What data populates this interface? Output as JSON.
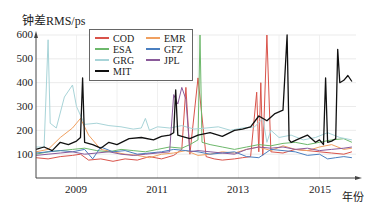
{
  "chart_data": {
    "type": "line",
    "title": "",
    "ylabel": "钟差RMS/ps",
    "xlabel": "年份",
    "ylim": [
      0,
      600
    ],
    "xlim": [
      2008.0,
      2016.0
    ],
    "yticks": [
      100,
      200,
      300,
      400,
      500,
      600
    ],
    "xticks": [
      "2009",
      "2011",
      "2013",
      "2015"
    ],
    "grid": true,
    "legend_position": "upper left (inside, offset)",
    "series": [
      {
        "name": "COD",
        "color": "#d9534a",
        "x": [
          2008.0,
          2008.3,
          2008.6,
          2008.9,
          2009.1,
          2009.3,
          2009.6,
          2009.9,
          2010.2,
          2010.5,
          2010.8,
          2011.1,
          2011.4,
          2011.6,
          2011.7,
          2011.8,
          2012.0,
          2012.2,
          2012.4,
          2012.6,
          2012.9,
          2013.1,
          2013.3,
          2013.45,
          2013.5,
          2013.55,
          2013.6,
          2013.7,
          2013.8,
          2014.1,
          2014.4,
          2014.7,
          2015.0,
          2015.3,
          2015.6,
          2015.8
        ],
        "values": [
          85,
          80,
          90,
          95,
          100,
          75,
          80,
          70,
          80,
          75,
          90,
          80,
          95,
          120,
          380,
          100,
          420,
          90,
          80,
          75,
          80,
          85,
          90,
          360,
          110,
          400,
          95,
          600,
          110,
          105,
          120,
          115,
          110,
          105,
          100,
          110
        ]
      },
      {
        "name": "EMR",
        "color": "#f0a060",
        "x": [
          2008.0,
          2008.3,
          2008.6,
          2008.9,
          2009.1,
          2009.3,
          2009.6,
          2009.9,
          2010.2,
          2010.5,
          2010.8,
          2011.1,
          2011.4,
          2011.7,
          2012.0,
          2012.3,
          2012.6,
          2012.9,
          2013.2,
          2013.5,
          2013.8,
          2014.1,
          2014.4,
          2014.7,
          2015.0,
          2015.3,
          2015.6,
          2015.8
        ],
        "values": [
          110,
          120,
          170,
          210,
          250,
          180,
          120,
          110,
          100,
          95,
          85,
          100,
          105,
          115,
          95,
          100,
          110,
          105,
          120,
          130,
          115,
          135,
          120,
          115,
          130,
          140,
          120,
          125
        ]
      },
      {
        "name": "ESA",
        "color": "#6db86b",
        "x": [
          2008.0,
          2008.3,
          2008.6,
          2008.9,
          2009.2,
          2009.5,
          2009.8,
          2010.1,
          2010.4,
          2010.7,
          2011.0,
          2011.3,
          2011.6,
          2011.8,
          2012.0,
          2012.05,
          2012.1,
          2012.3,
          2012.6,
          2012.9,
          2013.2,
          2013.5,
          2013.8,
          2014.1,
          2014.4,
          2014.7,
          2015.0,
          2015.3,
          2015.6,
          2015.8
        ],
        "values": [
          100,
          110,
          115,
          120,
          125,
          115,
          110,
          120,
          115,
          110,
          120,
          130,
          125,
          140,
          160,
          600,
          150,
          140,
          130,
          120,
          130,
          140,
          135,
          145,
          150,
          140,
          150,
          160,
          165,
          150
        ]
      },
      {
        "name": "GFZ",
        "color": "#4a7fc0",
        "x": [
          2008.0,
          2008.3,
          2008.6,
          2008.9,
          2009.2,
          2009.4,
          2009.6,
          2009.9,
          2010.2,
          2010.5,
          2010.8,
          2011.1,
          2011.4,
          2011.7,
          2012.0,
          2012.3,
          2012.6,
          2012.9,
          2013.2,
          2013.5,
          2013.8,
          2014.1,
          2014.4,
          2014.7,
          2015.0,
          2015.2,
          2015.4,
          2015.6,
          2015.8
        ],
        "values": [
          105,
          110,
          115,
          110,
          120,
          80,
          130,
          110,
          115,
          100,
          105,
          110,
          120,
          115,
          110,
          100,
          105,
          110,
          90,
          85,
          120,
          115,
          110,
          95,
          100,
          80,
          85,
          90,
          85
        ]
      },
      {
        "name": "GRG",
        "color": "#a8d4d8",
        "x": [
          2008.0,
          2008.2,
          2008.3,
          2008.35,
          2008.5,
          2008.7,
          2008.9,
          2009.0,
          2009.2,
          2009.5,
          2009.8,
          2010.1,
          2010.4,
          2010.6,
          2010.7,
          2010.8,
          2011.0,
          2011.3,
          2011.6,
          2011.9,
          2012.2,
          2012.5,
          2012.8,
          2013.1,
          2013.4,
          2013.6,
          2013.7,
          2013.8,
          2014.0,
          2014.3,
          2014.6,
          2014.9,
          2015.2,
          2015.5,
          2015.8
        ],
        "values": [
          130,
          130,
          580,
          230,
          210,
          340,
          390,
          300,
          225,
          230,
          220,
          215,
          205,
          210,
          250,
          200,
          215,
          210,
          220,
          205,
          210,
          215,
          200,
          210,
          215,
          250,
          150,
          200,
          170,
          180,
          160,
          170,
          190,
          170,
          160
        ]
      },
      {
        "name": "JPL",
        "color": "#8a5a9a",
        "x": [
          2008.0,
          2008.3,
          2008.6,
          2008.9,
          2009.2,
          2009.5,
          2009.8,
          2010.1,
          2010.4,
          2010.7,
          2011.0,
          2011.3,
          2011.4,
          2011.5,
          2011.6,
          2011.7,
          2011.8,
          2012.0,
          2012.3,
          2012.6,
          2012.9,
          2013.2,
          2013.5,
          2013.8,
          2014.1,
          2014.4,
          2014.7,
          2015.0,
          2015.3,
          2015.6,
          2015.8
        ],
        "values": [
          95,
          100,
          105,
          110,
          100,
          105,
          110,
          100,
          95,
          100,
          105,
          110,
          350,
          310,
          380,
          330,
          110,
          115,
          110,
          105,
          100,
          120,
          130,
          125,
          130,
          120,
          125,
          115,
          120,
          125,
          130
        ]
      },
      {
        "name": "MIT",
        "color": "#111111",
        "x": [
          2008.0,
          2008.2,
          2008.4,
          2008.6,
          2008.8,
          2009.0,
          2009.1,
          2009.15,
          2009.2,
          2009.4,
          2009.6,
          2009.8,
          2010.0,
          2010.3,
          2010.6,
          2010.9,
          2011.1,
          2011.3,
          2011.4,
          2011.45,
          2011.5,
          2011.6,
          2011.8,
          2012.0,
          2012.3,
          2012.6,
          2012.9,
          2013.1,
          2013.3,
          2013.5,
          2013.7,
          2013.9,
          2014.1,
          2014.2,
          2014.25,
          2014.3,
          2014.5,
          2014.7,
          2014.9,
          2015.0,
          2015.1,
          2015.15,
          2015.2,
          2015.3,
          2015.4,
          2015.45,
          2015.5,
          2015.6,
          2015.7,
          2015.8
        ],
        "values": [
          120,
          130,
          115,
          150,
          140,
          155,
          170,
          420,
          150,
          140,
          125,
          150,
          140,
          165,
          170,
          160,
          175,
          180,
          190,
          370,
          180,
          175,
          165,
          180,
          190,
          175,
          200,
          205,
          215,
          260,
          240,
          270,
          285,
          620,
          160,
          150,
          165,
          180,
          150,
          160,
          140,
          420,
          150,
          155,
          165,
          540,
          400,
          410,
          430,
          405
        ]
      }
    ]
  },
  "axes": {
    "ylabel": "钟差RMS/ps",
    "xlabel": "年份",
    "yticks": [
      "100",
      "200",
      "300",
      "400",
      "500",
      "600"
    ],
    "xticks": [
      "2009",
      "2011",
      "2013",
      "2015"
    ]
  },
  "legend": {
    "items": [
      {
        "label": "COD",
        "color": "#d9534a"
      },
      {
        "label": "EMR",
        "color": "#f0a060"
      },
      {
        "label": "ESA",
        "color": "#6db86b"
      },
      {
        "label": "GFZ",
        "color": "#4a7fc0"
      },
      {
        "label": "GRG",
        "color": "#a8d4d8"
      },
      {
        "label": "JPL",
        "color": "#8a5a9a"
      },
      {
        "label": "MIT",
        "color": "#111111"
      }
    ]
  }
}
